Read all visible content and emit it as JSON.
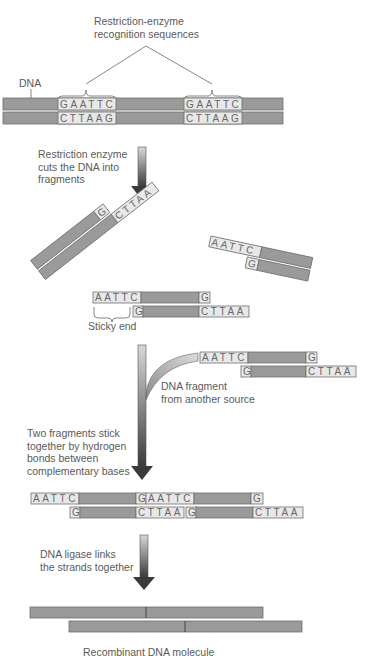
{
  "colors": {
    "strand": "#9a9a9a",
    "strand_border": "#6e6e6e",
    "sequence_box": "#e8e8e8",
    "arrow_light": "#d8d8d8",
    "arrow_dark": "#3a3a3a",
    "text": "#5a5a5a"
  },
  "labels": {
    "recognition": [
      "Restriction-enzyme",
      "recognition sequences"
    ],
    "dna": "DNA",
    "step1": [
      "Restriction enzyme",
      "cuts the DNA into",
      "fragments"
    ],
    "sticky_end": "Sticky end",
    "foreign_fragment": [
      "DNA fragment",
      "from another source"
    ],
    "step2": [
      "Two fragments stick",
      "together by hydrogen",
      "bonds between",
      "complementary bases"
    ],
    "step3": [
      "DNA ligase links",
      "the strands together"
    ],
    "result": "Recombinant DNA molecule"
  },
  "sequences": {
    "top_recognition": "GAATTC",
    "bottom_recognition": "CTTAAG",
    "sticky_top": "AATTC",
    "sticky_bottom": "CTTAA",
    "g": "G"
  }
}
